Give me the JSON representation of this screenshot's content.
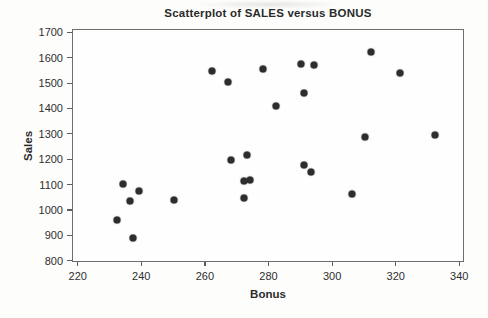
{
  "chart_data": {
    "type": "scatter",
    "title": "Scatterplot of SALES versus BONUS",
    "xlabel": "Bonus",
    "ylabel": "Sales",
    "xlim": [
      220,
      340
    ],
    "ylim": [
      800,
      1700
    ],
    "xticks": [
      220,
      240,
      260,
      280,
      300,
      320,
      340
    ],
    "yticks": [
      800,
      900,
      1000,
      1100,
      1200,
      1300,
      1400,
      1500,
      1600,
      1700
    ],
    "grid": false,
    "legend": false,
    "point_color": "#2d2d2d",
    "frame_color": "#6e6e6e",
    "points": [
      {
        "x": 232,
        "y": 965
      },
      {
        "x": 234,
        "y": 1105
      },
      {
        "x": 236,
        "y": 1040
      },
      {
        "x": 237,
        "y": 895
      },
      {
        "x": 239,
        "y": 1078
      },
      {
        "x": 250,
        "y": 1043
      },
      {
        "x": 262,
        "y": 1550
      },
      {
        "x": 267,
        "y": 1508
      },
      {
        "x": 268,
        "y": 1202
      },
      {
        "x": 272,
        "y": 1052
      },
      {
        "x": 272,
        "y": 1118
      },
      {
        "x": 274,
        "y": 1120
      },
      {
        "x": 273,
        "y": 1222
      },
      {
        "x": 278,
        "y": 1560
      },
      {
        "x": 282,
        "y": 1415
      },
      {
        "x": 290,
        "y": 1578
      },
      {
        "x": 291,
        "y": 1465
      },
      {
        "x": 291,
        "y": 1182
      },
      {
        "x": 293,
        "y": 1152
      },
      {
        "x": 294,
        "y": 1576
      },
      {
        "x": 306,
        "y": 1068
      },
      {
        "x": 310,
        "y": 1293
      },
      {
        "x": 312,
        "y": 1628
      },
      {
        "x": 321,
        "y": 1543
      },
      {
        "x": 332,
        "y": 1300
      }
    ]
  }
}
